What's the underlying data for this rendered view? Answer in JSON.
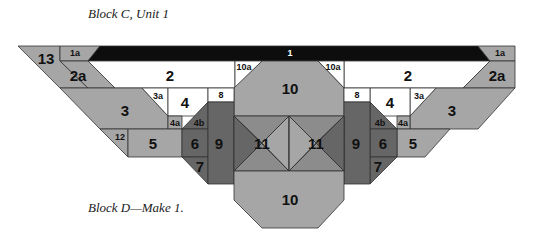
{
  "captions": {
    "top": "Block C, Unit 1",
    "bottom": "Block D—Make 1."
  },
  "colors": {
    "black": "#0d0d0d",
    "white": "#ffffff",
    "light": "#a6a6a6",
    "medium": "#8c8c8c",
    "dark": "#666666",
    "outline": "#333333"
  },
  "pieces": [
    {
      "id": "13",
      "fill": "light",
      "points": "18,46 60,46 60,61 88,88 60,88"
    },
    {
      "id": "1a-left",
      "fill": "light",
      "points": "60,46 100,46 88,61 60,61"
    },
    {
      "id": "2a-left",
      "fill": "light",
      "points": "60,61 88,61 115,88 88,88"
    },
    {
      "id": "1",
      "fill": "black",
      "points": "100,46 478,46 490,61 88,61"
    },
    {
      "id": "1a-right",
      "fill": "light",
      "points": "478,46 515,46 515,61 490,61"
    },
    {
      "id": "2-left",
      "fill": "white",
      "points": "88,61 235,61 235,88 115,88"
    },
    {
      "id": "2-right",
      "fill": "white",
      "points": "344,61 490,61 463,88 344,88"
    },
    {
      "id": "2a-right",
      "fill": "light",
      "points": "490,61 515,61 515,88 463,88"
    },
    {
      "id": "10a-left",
      "fill": "white",
      "points": "235,61 262,61 235,88"
    },
    {
      "id": "10a-right",
      "fill": "white",
      "points": "318,61 344,61 344,88"
    },
    {
      "id": "10-top",
      "fill": "light",
      "points": "262,61 318,61 344,88 344,116 234,116 234,88"
    },
    {
      "id": "3-left",
      "fill": "light",
      "points": "60,88 142,88 168,116 168,129 100,129"
    },
    {
      "id": "3a-left",
      "fill": "white",
      "points": "142,88 168,88 168,116"
    },
    {
      "id": "4-left",
      "fill": "white",
      "points": "168,88 208,88 208,102 195,116 168,116"
    },
    {
      "id": "8-left",
      "fill": "white",
      "points": "208,88 234,88 234,102 208,102"
    },
    {
      "id": "3-right",
      "fill": "light",
      "points": "436,88 515,88 478,129 410,129 410,116"
    },
    {
      "id": "3a-right",
      "fill": "white",
      "points": "410,88 436,88 410,116"
    },
    {
      "id": "4-right",
      "fill": "white",
      "points": "370,88 410,88 410,116 383,116 370,102"
    },
    {
      "id": "8-right",
      "fill": "white",
      "points": "344,88 370,88 370,102 344,102"
    },
    {
      "id": "4a-left",
      "fill": "light",
      "points": "168,116 182,116 182,129 168,129"
    },
    {
      "id": "4b-left",
      "fill": "dark",
      "points": "182,129 208,102 208,129"
    },
    {
      "id": "4a-right",
      "fill": "light",
      "points": "397,116 410,116 410,129 397,129"
    },
    {
      "id": "4b-right",
      "fill": "dark",
      "points": "370,102 397,129 370,129"
    },
    {
      "id": "12",
      "fill": "light",
      "points": "100,129 128,129 128,157"
    },
    {
      "id": "5-left",
      "fill": "light",
      "points": "128,129 182,129 182,157 128,157"
    },
    {
      "id": "5-right",
      "fill": "light",
      "points": "397,129 450,129 425,157 397,157"
    },
    {
      "id": "6-left",
      "fill": "dark",
      "points": "182,129 208,129 208,157 182,157"
    },
    {
      "id": "6-right",
      "fill": "dark",
      "points": "370,129 397,129 397,157 370,157"
    },
    {
      "id": "7-left",
      "fill": "dark",
      "points": "182,157 208,157 208,184"
    },
    {
      "id": "7-right",
      "fill": "dark",
      "points": "370,157 397,157 370,184"
    },
    {
      "id": "9-left",
      "fill": "dark",
      "points": "208,102 234,102 234,184 208,184"
    },
    {
      "id": "9-right",
      "fill": "dark",
      "points": "344,102 370,102 370,184 344,184"
    },
    {
      "id": "11-rect",
      "fill": "medium",
      "points": "234,116 344,116 344,171 234,171"
    },
    {
      "id": "11-dark-left",
      "fill": "dark",
      "points": "234,116 262,143 234,171"
    },
    {
      "id": "11-dark-right",
      "fill": "dark",
      "points": "344,116 316,143 344,171"
    },
    {
      "id": "11-diamond-left",
      "fill": "light",
      "points": "289,116 262,143 289,171"
    },
    {
      "id": "11-diamond-right",
      "fill": "light",
      "points": "289,116 316,143 289,171"
    },
    {
      "id": "10-bottom",
      "fill": "light",
      "points": "234,171 344,171 344,200 318,228 262,228 234,200"
    }
  ],
  "lines": [
    {
      "x1": 234,
      "y1": 116,
      "x2": 289,
      "y2": 171
    },
    {
      "x1": 234,
      "y1": 171,
      "x2": 289,
      "y2": 116
    },
    {
      "x1": 344,
      "y1": 116,
      "x2": 289,
      "y2": 171
    },
    {
      "x1": 344,
      "y1": 171,
      "x2": 289,
      "y2": 116
    },
    {
      "x1": 289,
      "y1": 116,
      "x2": 289,
      "y2": 171
    }
  ],
  "labels": [
    {
      "text": "13",
      "x": 46,
      "y": 58,
      "size": "lg"
    },
    {
      "text": "1a",
      "x": 75,
      "y": 53,
      "size": "sm"
    },
    {
      "text": "2a",
      "x": 78,
      "y": 75,
      "size": "lg"
    },
    {
      "text": "1",
      "x": 290,
      "y": 53,
      "size": "sm",
      "inverse": true
    },
    {
      "text": "1a",
      "x": 500,
      "y": 53,
      "size": "sm"
    },
    {
      "text": "2",
      "x": 170,
      "y": 75,
      "size": "lg"
    },
    {
      "text": "2",
      "x": 408,
      "y": 75,
      "size": "lg"
    },
    {
      "text": "2a",
      "x": 497,
      "y": 75,
      "size": "lg"
    },
    {
      "text": "10a",
      "x": 244,
      "y": 67,
      "size": "sm"
    },
    {
      "text": "10a",
      "x": 333,
      "y": 67,
      "size": "sm"
    },
    {
      "text": "10",
      "x": 290,
      "y": 88,
      "size": "lg"
    },
    {
      "text": "3",
      "x": 125,
      "y": 110,
      "size": "lg"
    },
    {
      "text": "3a",
      "x": 158,
      "y": 96,
      "size": "sm"
    },
    {
      "text": "4",
      "x": 185,
      "y": 102,
      "size": "lg"
    },
    {
      "text": "8",
      "x": 221,
      "y": 95,
      "size": "sm"
    },
    {
      "text": "8",
      "x": 357,
      "y": 95,
      "size": "sm"
    },
    {
      "text": "4",
      "x": 390,
      "y": 102,
      "size": "lg"
    },
    {
      "text": "3a",
      "x": 419,
      "y": 96,
      "size": "sm"
    },
    {
      "text": "3",
      "x": 452,
      "y": 110,
      "size": "lg"
    },
    {
      "text": "4a",
      "x": 175,
      "y": 123,
      "size": "sm"
    },
    {
      "text": "4b",
      "x": 199,
      "y": 123,
      "size": "sm"
    },
    {
      "text": "4b",
      "x": 380,
      "y": 123,
      "size": "sm"
    },
    {
      "text": "4a",
      "x": 403,
      "y": 123,
      "size": "sm"
    },
    {
      "text": "12",
      "x": 120,
      "y": 137,
      "size": "sm"
    },
    {
      "text": "5",
      "x": 153,
      "y": 143,
      "size": "lg"
    },
    {
      "text": "6",
      "x": 195,
      "y": 143,
      "size": "lg"
    },
    {
      "text": "9",
      "x": 219,
      "y": 143,
      "size": "lg"
    },
    {
      "text": "11",
      "x": 262,
      "y": 143,
      "size": "lg"
    },
    {
      "text": "11",
      "x": 316,
      "y": 143,
      "size": "lg"
    },
    {
      "text": "9",
      "x": 356,
      "y": 143,
      "size": "lg"
    },
    {
      "text": "6",
      "x": 383,
      "y": 143,
      "size": "lg"
    },
    {
      "text": "5",
      "x": 413,
      "y": 143,
      "size": "lg"
    },
    {
      "text": "7",
      "x": 200,
      "y": 166,
      "size": "lg"
    },
    {
      "text": "7",
      "x": 378,
      "y": 166,
      "size": "lg"
    },
    {
      "text": "10",
      "x": 290,
      "y": 199,
      "size": "lg"
    }
  ]
}
